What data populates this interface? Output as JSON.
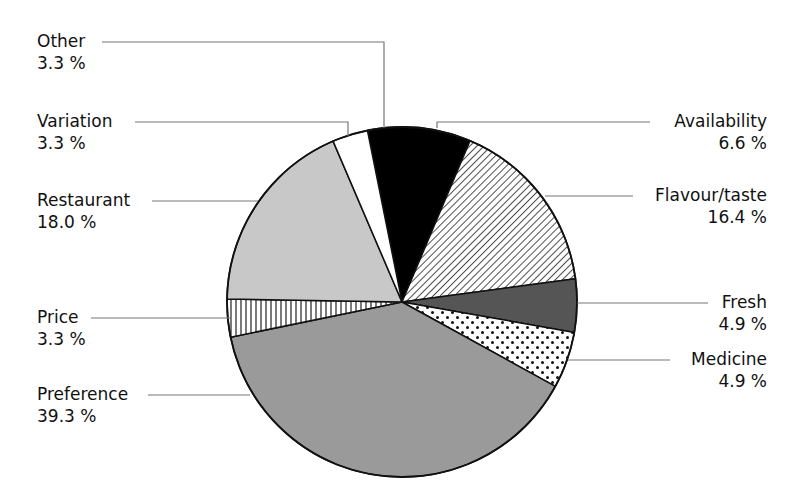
{
  "chart_data": {
    "type": "pie",
    "title": "",
    "start_angle_deg": -11.4,
    "direction": "clockwise",
    "center": [
      402,
      302
    ],
    "radius": 175,
    "slices": [
      {
        "label": "Availability",
        "value": 6.6,
        "display": "6.6 %",
        "fill": "#000000",
        "pattern": "solid-black",
        "angles": [
          -11.4,
          22.9
        ]
      },
      {
        "label": "Flavour/taste",
        "value": 16.4,
        "display": "16.4 %",
        "fill": "#ffffff",
        "pattern": "diagonal-hatch",
        "angles": [
          22.9,
          82.4
        ]
      },
      {
        "label": "Fresh",
        "value": 4.9,
        "display": "4.9 %",
        "fill": "#555555",
        "pattern": "dark-grey",
        "angles": [
          82.4,
          100.0
        ]
      },
      {
        "label": "Medicine",
        "value": 4.9,
        "display": "4.9 %",
        "fill": "#ffffff",
        "pattern": "dots",
        "angles": [
          100.0,
          118.8
        ]
      },
      {
        "label": "Preference",
        "value": 39.3,
        "display": "39.3 %",
        "fill": "#9a9a9a",
        "pattern": "medium-grey",
        "angles": [
          118.8,
          258.4
        ]
      },
      {
        "label": "Price",
        "value": 3.3,
        "display": "3.3 %",
        "fill": "#ffffff",
        "pattern": "vertical-lines",
        "angles": [
          258.4,
          271.0
        ]
      },
      {
        "label": "Restaurant",
        "value": 18.0,
        "display": "18.0 %",
        "fill": "#c8c8c8",
        "pattern": "light-grey",
        "angles": [
          271.0,
          336.8
        ]
      },
      {
        "label": "Variation",
        "value": 3.3,
        "display": "3.3 %",
        "fill": "#ffffff",
        "pattern": "white",
        "angles": [
          336.8,
          348.6
        ]
      },
      {
        "label": "Other",
        "value": 3.3,
        "display": "3.3 %",
        "fill": "#000000",
        "pattern": "solid-black",
        "angles": [
          348.6,
          348.6
        ]
      }
    ],
    "legend_position": "callout-labels"
  },
  "labels": {
    "other": {
      "name": "Other",
      "pct": "3.3 %"
    },
    "variation": {
      "name": "Variation",
      "pct": "3.3 %"
    },
    "restaurant": {
      "name": "Restaurant",
      "pct": "18.0 %"
    },
    "price": {
      "name": "Price",
      "pct": "3.3 %"
    },
    "preference": {
      "name": "Preference",
      "pct": "39.3 %"
    },
    "availability": {
      "name": "Availability",
      "pct": "6.6 %"
    },
    "flavour": {
      "name": "Flavour/taste",
      "pct": "16.4 %"
    },
    "fresh": {
      "name": "Fresh",
      "pct": "4.9 %"
    },
    "medicine": {
      "name": "Medicine",
      "pct": "4.9 %"
    }
  }
}
